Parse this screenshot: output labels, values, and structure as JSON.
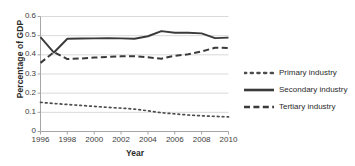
{
  "chart_data": {
    "type": "line",
    "title": "",
    "xlabel": "Year",
    "ylabel": "Percentage of GDP",
    "xlim": [
      1996,
      2010
    ],
    "ylim": [
      0,
      0.6
    ],
    "grid": true,
    "legend_position": "right",
    "x": [
      1996,
      1997,
      1998,
      1999,
      2000,
      2001,
      2002,
      2003,
      2004,
      2005,
      2006,
      2007,
      2008,
      2009,
      2010
    ],
    "x_tick_labels": [
      "1996",
      "1998",
      "2000",
      "2002",
      "2004",
      "2006",
      "2008",
      "2010"
    ],
    "x_tick_values": [
      1996,
      1998,
      2000,
      2002,
      2004,
      2006,
      2008,
      2010
    ],
    "y_tick_labels": [
      "0",
      "0.1",
      "0.2",
      "0.3",
      "0.4",
      "0.5",
      "0.6"
    ],
    "y_tick_values": [
      0,
      0.1,
      0.2,
      0.3,
      0.4,
      0.5,
      0.6
    ],
    "series": [
      {
        "name": "Primary industry",
        "style": "dotted",
        "color": "#4d4d4d",
        "values": [
          0.152,
          0.146,
          0.141,
          0.136,
          0.131,
          0.126,
          0.122,
          0.117,
          0.108,
          0.098,
          0.092,
          0.086,
          0.082,
          0.079,
          0.076
        ]
      },
      {
        "name": "Secondary industry",
        "style": "solid",
        "color": "#3a3a3a",
        "values": [
          0.492,
          0.412,
          0.484,
          0.485,
          0.486,
          0.487,
          0.486,
          0.484,
          0.497,
          0.524,
          0.515,
          0.515,
          0.512,
          0.487,
          0.49
        ]
      },
      {
        "name": "Tertiary industry",
        "style": "dashed",
        "color": "#3a3a3a",
        "values": [
          0.358,
          0.414,
          0.378,
          0.381,
          0.386,
          0.389,
          0.392,
          0.393,
          0.387,
          0.38,
          0.395,
          0.403,
          0.418,
          0.437,
          0.436
        ]
      }
    ]
  },
  "legend": {
    "items": [
      {
        "label": "Primary industry"
      },
      {
        "label": "Secondary industry"
      },
      {
        "label": "Tertiary industry"
      }
    ]
  },
  "axes": {
    "x_title": "Year",
    "y_title": "Percentage of GDP"
  },
  "colors": {
    "grid": "#d9d9d9",
    "axis": "#a6a6a6",
    "ink": "#3a3a3a"
  }
}
